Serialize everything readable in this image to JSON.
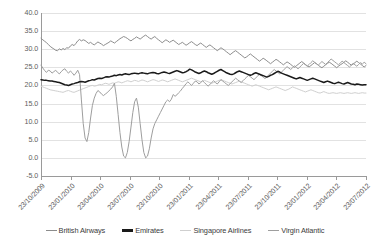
{
  "chart_data": {
    "type": "line",
    "title": "",
    "xlabel": "",
    "ylabel": "",
    "ylim": [
      -5.0,
      40.0
    ],
    "yticks": [
      "40.0",
      "35.0",
      "30.0",
      "25.0",
      "20.0",
      "15.0",
      "10.0",
      "5.0",
      "0.0",
      "-5.0"
    ],
    "ytick_values": [
      40.0,
      35.0,
      30.0,
      25.0,
      20.0,
      15.0,
      10.0,
      5.0,
      0.0,
      -5.0
    ],
    "grid": true,
    "legend_position": "bottom",
    "xtick_labels": [
      "23/10/2009",
      "23/01/2010",
      "23/04/2010",
      "23/07/2010",
      "23/10/2010",
      "23/01/2011",
      "23/04/2011",
      "23/07/2011",
      "23/10/2011",
      "23/01/2012",
      "23/04/2012",
      "23/07/2012"
    ],
    "x_start": "23/10/2009",
    "x_end": "23/07/2012",
    "colors": {
      "british_airways": "#8c8c8c",
      "emirates": "#1a1a1a",
      "singapore_airlines": "#cfcfcf",
      "virgin_atlantic": "#9e9e9e",
      "gridline": "#e2e2e2",
      "axis": "#9a9a9a",
      "tick_text": "#5e5e5e",
      "legend_text": "#3b3b3b",
      "background": "#ffffff"
    },
    "series": [
      {
        "name": "British Airways",
        "color": "#8c8c8c",
        "values": [
          33.0,
          32.6,
          32.2,
          31.8,
          31.3,
          30.8,
          30.4,
          30.1,
          29.7,
          29.6,
          30.1,
          29.8,
          30.2,
          29.9,
          30.4,
          30.3,
          30.9,
          31.3,
          31.0,
          31.6,
          32.3,
          32.7,
          32.3,
          32.6,
          32.4,
          32.0,
          31.6,
          31.9,
          31.5,
          31.2,
          31.6,
          32.0,
          31.7,
          31.4,
          31.0,
          31.3,
          31.6,
          31.9,
          32.3,
          32.0,
          31.7,
          32.1,
          32.5,
          32.9,
          33.2,
          33.5,
          33.3,
          33.0,
          32.6,
          32.3,
          32.7,
          33.0,
          33.4,
          33.1,
          32.8,
          33.2,
          33.6,
          33.9,
          33.5,
          33.1,
          32.8,
          33.2,
          33.5,
          33.0,
          32.6,
          32.2,
          31.8,
          32.2,
          32.6,
          32.3,
          31.9,
          32.2,
          32.5,
          32.1,
          31.7,
          31.3,
          31.6,
          31.9,
          31.5,
          31.1,
          31.4,
          31.8,
          32.1,
          31.7,
          31.3,
          31.0,
          31.4,
          31.7,
          31.3,
          30.9,
          30.5,
          30.9,
          31.2,
          30.8,
          30.4,
          30.0,
          29.6,
          30.0,
          30.4,
          30.1,
          29.7,
          29.3,
          28.9,
          28.5,
          28.9,
          29.3,
          29.6,
          29.2,
          28.8,
          28.4,
          28.0,
          27.6,
          27.9,
          28.3,
          28.7,
          28.3,
          27.9,
          27.5,
          27.1,
          26.7,
          27.1,
          27.5,
          27.2,
          26.8,
          26.4,
          26.0,
          26.4,
          26.8,
          27.2,
          26.9,
          26.5,
          26.1,
          25.7,
          26.1,
          26.5,
          26.2,
          25.8,
          25.4,
          25.0,
          25.4,
          25.8,
          26.2,
          26.6,
          26.2,
          25.8,
          25.4,
          25.1,
          25.5,
          25.9,
          26.3,
          26.0,
          25.6,
          25.2,
          24.9,
          25.3,
          25.7,
          26.1,
          26.4,
          26.1,
          25.7,
          25.3,
          24.9,
          25.3,
          25.7,
          26.0,
          26.4,
          26.8,
          26.4,
          26.0,
          25.6,
          25.9,
          26.3,
          26.7,
          26.3,
          25.9,
          25.5,
          25.1,
          25.5
        ]
      },
      {
        "name": "Emirates",
        "color": "#1a1a1a",
        "values": [
          21.6,
          21.5,
          21.4,
          21.4,
          21.3,
          21.2,
          21.2,
          21.1,
          21.0,
          20.9,
          20.8,
          20.6,
          20.4,
          20.2,
          20.1,
          20.0,
          20.2,
          20.4,
          20.5,
          20.7,
          20.8,
          21.0,
          21.1,
          21.0,
          20.9,
          21.1,
          21.3,
          21.4,
          21.6,
          21.5,
          21.7,
          21.9,
          22.0,
          21.9,
          22.1,
          22.3,
          22.4,
          22.3,
          22.5,
          22.6,
          22.8,
          22.7,
          22.9,
          23.0,
          22.9,
          23.1,
          23.2,
          23.1,
          23.0,
          23.2,
          23.3,
          23.4,
          23.3,
          23.2,
          23.4,
          23.5,
          23.4,
          23.3,
          23.2,
          23.4,
          23.5,
          23.6,
          23.5,
          23.3,
          23.2,
          23.4,
          23.6,
          23.7,
          23.6,
          23.4,
          23.3,
          23.5,
          23.7,
          23.9,
          24.1,
          23.9,
          23.7,
          23.5,
          23.6,
          23.8,
          24.1,
          24.5,
          24.3,
          24.0,
          23.7,
          23.5,
          23.3,
          23.5,
          23.8,
          24.0,
          23.8,
          23.5,
          23.3,
          23.1,
          23.3,
          23.6,
          23.9,
          24.2,
          24.4,
          24.1,
          23.8,
          23.5,
          23.3,
          23.1,
          23.0,
          23.2,
          23.5,
          23.8,
          24.0,
          23.8,
          23.6,
          23.4,
          23.2,
          23.0,
          22.8,
          23.0,
          23.3,
          23.5,
          23.3,
          23.1,
          22.9,
          22.7,
          22.5,
          22.3,
          22.5,
          22.8,
          23.0,
          23.3,
          23.6,
          23.9,
          23.7,
          23.4,
          23.2,
          23.0,
          22.8,
          22.6,
          22.4,
          22.2,
          22.0,
          21.8,
          22.0,
          22.2,
          22.0,
          21.8,
          21.6,
          21.4,
          21.6,
          21.8,
          22.0,
          21.8,
          21.6,
          21.4,
          21.2,
          21.0,
          20.8,
          21.0,
          21.2,
          21.0,
          20.8,
          20.6,
          20.5,
          20.7,
          20.9,
          20.7,
          20.5,
          20.4,
          20.6,
          20.8,
          20.6,
          20.4,
          20.3,
          20.2,
          20.4,
          20.3,
          20.2,
          20.1,
          20.2,
          20.2
        ]
      },
      {
        "name": "Singapore Airlines",
        "color": "#cfcfcf",
        "values": [
          19.8,
          19.6,
          19.4,
          19.2,
          19.0,
          18.8,
          18.7,
          18.6,
          18.5,
          18.4,
          18.3,
          18.2,
          18.1,
          18.3,
          18.5,
          18.6,
          18.4,
          18.2,
          18.1,
          18.3,
          18.5,
          18.7,
          18.9,
          19.1,
          19.3,
          19.5,
          19.7,
          19.9,
          20.0,
          19.8,
          19.9,
          20.1,
          20.3,
          20.2,
          20.4,
          20.6,
          20.5,
          20.3,
          20.5,
          20.7,
          20.6,
          20.8,
          21.0,
          20.9,
          20.7,
          20.9,
          21.1,
          21.3,
          21.2,
          21.0,
          21.2,
          21.4,
          21.3,
          21.1,
          21.3,
          21.5,
          21.4,
          21.2,
          21.0,
          21.2,
          21.4,
          21.6,
          21.5,
          21.3,
          21.1,
          21.3,
          21.5,
          21.4,
          21.2,
          21.0,
          21.2,
          21.4,
          21.6,
          21.8,
          21.6,
          21.4,
          21.2,
          21.0,
          21.2,
          21.4,
          21.6,
          21.8,
          22.0,
          21.8,
          21.6,
          21.4,
          21.2,
          21.0,
          21.2,
          21.4,
          21.2,
          21.0,
          20.8,
          20.6,
          20.8,
          21.0,
          21.2,
          21.4,
          21.6,
          21.4,
          21.2,
          21.0,
          20.8,
          20.6,
          20.4,
          20.6,
          20.8,
          21.0,
          21.2,
          21.0,
          20.8,
          20.6,
          20.4,
          20.2,
          20.0,
          19.8,
          20.0,
          20.2,
          20.0,
          19.8,
          19.6,
          19.4,
          19.2,
          19.0,
          18.8,
          19.0,
          19.2,
          19.4,
          19.6,
          19.4,
          19.2,
          19.0,
          18.8,
          18.6,
          18.8,
          19.0,
          19.3,
          19.6,
          19.4,
          19.2,
          19.0,
          18.8,
          18.6,
          18.4,
          18.2,
          18.4,
          18.6,
          18.8,
          18.6,
          18.4,
          18.2,
          18.0,
          17.9,
          18.1,
          18.3,
          18.1,
          17.9,
          17.8,
          17.9,
          18.0,
          17.9,
          17.8,
          17.9,
          18.0,
          17.9,
          17.8,
          17.9,
          18.0,
          17.9,
          17.8,
          17.9,
          18.0,
          17.9,
          17.8,
          17.9,
          18.0,
          17.9,
          17.9
        ]
      },
      {
        "name": "Virgin Atlantic",
        "color": "#9e9e9e",
        "values": [
          25.6,
          24.8,
          24.1,
          23.6,
          24.2,
          24.0,
          23.4,
          23.8,
          24.2,
          23.6,
          23.2,
          23.8,
          24.3,
          24.6,
          23.9,
          23.4,
          24.0,
          23.5,
          22.8,
          23.4,
          24.2,
          23.0,
          16.0,
          9.5,
          5.5,
          4.5,
          7.0,
          11.0,
          14.5,
          16.5,
          17.8,
          18.6,
          18.2,
          17.6,
          17.2,
          17.6,
          18.0,
          18.5,
          19.0,
          19.6,
          20.6,
          17.0,
          12.0,
          7.0,
          3.0,
          0.5,
          0.0,
          1.5,
          4.5,
          8.5,
          12.5,
          15.5,
          16.5,
          14.0,
          9.5,
          5.0,
          1.5,
          0.0,
          0.5,
          2.5,
          5.5,
          8.0,
          9.5,
          10.5,
          11.5,
          12.5,
          13.5,
          14.5,
          15.5,
          16.0,
          15.5,
          16.2,
          17.5,
          17.0,
          17.4,
          18.0,
          18.5,
          19.2,
          19.8,
          20.5,
          21.0,
          20.5,
          20.0,
          20.6,
          21.2,
          21.0,
          20.4,
          20.8,
          21.3,
          20.8,
          20.3,
          19.8,
          20.3,
          20.8,
          21.3,
          20.8,
          20.4,
          21.0,
          21.6,
          21.2,
          20.8,
          20.4,
          20.0,
          20.5,
          21.0,
          21.5,
          22.0,
          21.6,
          21.2,
          20.8,
          21.3,
          21.8,
          22.3,
          22.8,
          22.4,
          22.0,
          21.6,
          22.1,
          22.6,
          23.1,
          22.7,
          22.3,
          21.9,
          22.4,
          22.9,
          23.4,
          23.9,
          24.4,
          24.0,
          23.6,
          23.2,
          23.7,
          24.2,
          24.7,
          25.2,
          24.8,
          24.4,
          24.9,
          25.4,
          25.0,
          24.6,
          25.1,
          25.6,
          26.1,
          25.7,
          25.3,
          25.8,
          26.3,
          26.8,
          26.4,
          26.0,
          25.6,
          26.1,
          26.6,
          26.2,
          25.8,
          26.3,
          26.8,
          27.3,
          26.9,
          26.5,
          26.1,
          25.7,
          26.2,
          26.7,
          26.3,
          25.9,
          25.5,
          25.1,
          25.6,
          26.1,
          25.7,
          25.3,
          25.8,
          26.3,
          25.9,
          26.4,
          26.0
        ]
      }
    ]
  },
  "legend": {
    "items": [
      {
        "label": "British Airways",
        "color": "#8c8c8c"
      },
      {
        "label": "Emirates",
        "color": "#1a1a1a"
      },
      {
        "label": "Singapore Airlines",
        "color": "#cfcfcf"
      },
      {
        "label": "Virgin Atlantic",
        "color": "#9e9e9e"
      }
    ]
  }
}
